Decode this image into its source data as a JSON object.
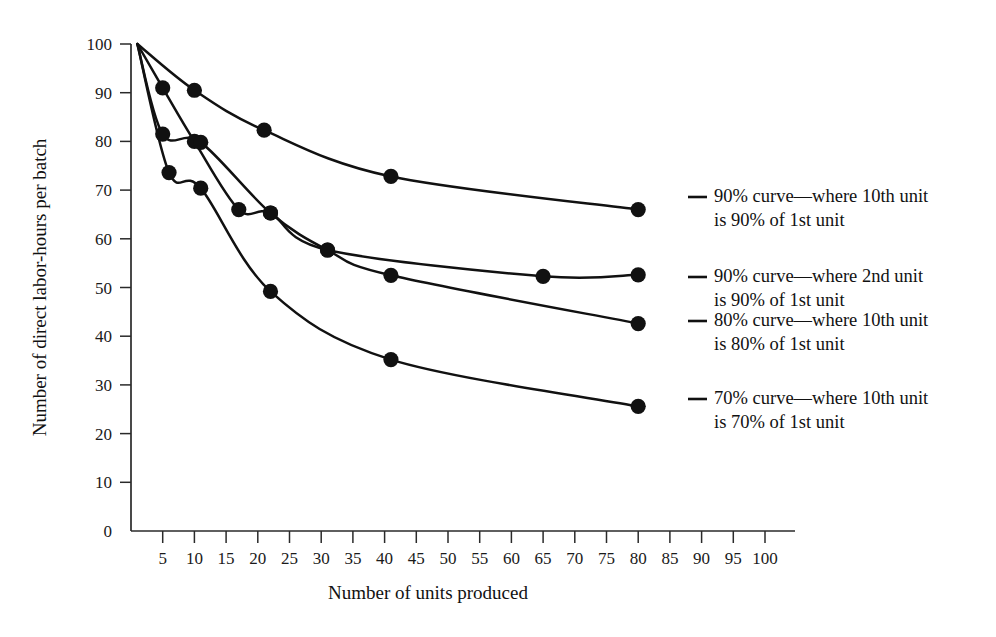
{
  "chart_data": {
    "type": "line",
    "title": "",
    "xlabel": "Number of units produced",
    "ylabel": "Number of direct labor-hours per batch",
    "xlim": [
      0,
      105
    ],
    "ylim": [
      0,
      100
    ],
    "xticks": [
      5,
      10,
      15,
      20,
      25,
      30,
      35,
      40,
      45,
      50,
      55,
      60,
      65,
      70,
      75,
      80,
      85,
      90,
      95,
      100
    ],
    "yticks": [
      0,
      10,
      20,
      30,
      40,
      50,
      60,
      70,
      80,
      90,
      100
    ],
    "grid": false,
    "legend_position": "right",
    "marker": "filled-circle",
    "series": [
      {
        "name": "90% curve—where 10th unit is 90% of 1st unit",
        "legend_line1": "90% curve—where 10th unit",
        "legend_line2": "is 90% of 1st unit",
        "points": [
          {
            "x": 1,
            "y": 100
          },
          {
            "x": 10,
            "y": 90.5
          },
          {
            "x": 21,
            "y": 82.3
          },
          {
            "x": 41,
            "y": 72.8
          },
          {
            "x": 80,
            "y": 66.0
          }
        ]
      },
      {
        "name": "90% curve—where 2nd unit is 90% of 1st unit",
        "legend_line1": "90% curve—where 2nd unit",
        "legend_line2": "is 90% of 1st unit",
        "points": [
          {
            "x": 1,
            "y": 100
          },
          {
            "x": 5,
            "y": 91.0
          },
          {
            "x": 10,
            "y": 80.0
          },
          {
            "x": 17,
            "y": 66.0
          },
          {
            "x": 22,
            "y": 65.3
          },
          {
            "x": 31,
            "y": 57.7
          },
          {
            "x": 65,
            "y": 52.3
          },
          {
            "x": 80,
            "y": 52.6
          }
        ]
      },
      {
        "name": "80% curve—where 10th unit is 80% of 1st unit",
        "legend_line1": "80% curve—where 10th unit",
        "legend_line2": "is 80% of 1st unit",
        "points": [
          {
            "x": 1,
            "y": 100
          },
          {
            "x": 5,
            "y": 81.5
          },
          {
            "x": 11,
            "y": 79.8
          },
          {
            "x": 22,
            "y": 65.3
          },
          {
            "x": 31,
            "y": 57.7
          },
          {
            "x": 41,
            "y": 52.5
          },
          {
            "x": 80,
            "y": 42.6
          }
        ]
      },
      {
        "name": "70% curve—where 10th unit is 70% of 1st unit",
        "legend_line1": "70% curve—where 10th unit",
        "legend_line2": "is 70% of 1st unit",
        "points": [
          {
            "x": 1,
            "y": 100
          },
          {
            "x": 6,
            "y": 73.6
          },
          {
            "x": 11,
            "y": 70.4
          },
          {
            "x": 22,
            "y": 49.2
          },
          {
            "x": 41,
            "y": 35.2
          },
          {
            "x": 80,
            "y": 25.6
          }
        ]
      }
    ]
  },
  "legend": [
    {
      "line1": "90% curve—where 10th unit",
      "line2": "is 90% of 1st unit"
    },
    {
      "line1": "90% curve—where 2nd unit",
      "line2": "is 90% of 1st unit"
    },
    {
      "line1": "80% curve—where 10th unit",
      "line2": "is 80% of 1st unit"
    },
    {
      "line1": "70% curve—where 10th unit",
      "line2": "is 70% of 1st unit"
    }
  ]
}
